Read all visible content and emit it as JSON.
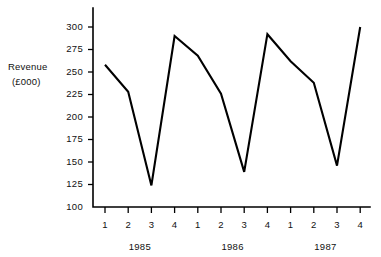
{
  "chart_data": {
    "type": "line",
    "title": "",
    "ylabel_line1": "Revenue",
    "ylabel_line2": "(£000)",
    "xlabel": "",
    "ylim": [
      100,
      300
    ],
    "yticks": [
      100,
      125,
      150,
      175,
      200,
      225,
      250,
      275,
      300
    ],
    "ytick_labels": [
      "100",
      "125",
      "150",
      "175",
      "200",
      "225",
      "250",
      "275",
      "300"
    ],
    "grid": false,
    "legend": null,
    "categories": [
      "1",
      "2",
      "3",
      "4",
      "1",
      "2",
      "3",
      "4",
      "1",
      "2",
      "3",
      "4"
    ],
    "xtick_labels": [
      "1",
      "2",
      "3",
      "4",
      "1",
      "2",
      "3",
      "4",
      "1",
      "2",
      "3",
      "4"
    ],
    "group_labels": [
      "1985",
      "1986",
      "1987"
    ],
    "series": [
      {
        "name": "Revenue",
        "color": "#000000",
        "values": [
          258,
          228,
          124,
          290,
          268,
          226,
          139,
          292,
          262,
          238,
          146,
          300
        ]
      }
    ],
    "points": [
      {
        "year": "1985",
        "quarter": "1",
        "value": 258
      },
      {
        "year": "1985",
        "quarter": "2",
        "value": 228
      },
      {
        "year": "1985",
        "quarter": "3",
        "value": 124
      },
      {
        "year": "1985",
        "quarter": "4",
        "value": 290
      },
      {
        "year": "1986",
        "quarter": "1",
        "value": 268
      },
      {
        "year": "1986",
        "quarter": "2",
        "value": 226
      },
      {
        "year": "1986",
        "quarter": "3",
        "value": 139
      },
      {
        "year": "1986",
        "quarter": "4",
        "value": 292
      },
      {
        "year": "1987",
        "quarter": "1",
        "value": 262
      },
      {
        "year": "1987",
        "quarter": "2",
        "value": 238
      },
      {
        "year": "1987",
        "quarter": "3",
        "value": 146
      },
      {
        "year": "1987",
        "quarter": "4",
        "value": 300
      }
    ]
  },
  "colors": {
    "line": "#000000",
    "axis": "#000000",
    "text": "#111111",
    "background": "#ffffff"
  }
}
